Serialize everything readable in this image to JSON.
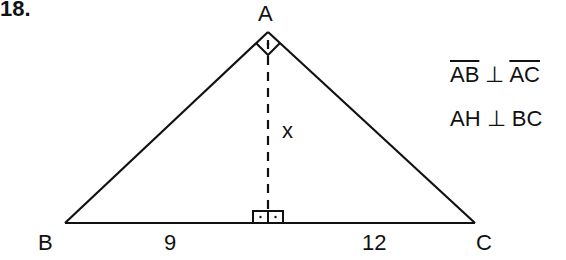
{
  "problem": {
    "number": "18."
  },
  "diagram": {
    "vertices": {
      "A": "A",
      "B": "B",
      "C": "C"
    },
    "segments": {
      "BH": "9",
      "HC": "12",
      "AH": "x"
    },
    "right_angles": [
      "A",
      "H"
    ]
  },
  "relations": {
    "line1": {
      "left": "AB",
      "symbol": "⊥",
      "right": "AC",
      "overline": true
    },
    "line2": {
      "left": "AH",
      "symbol": "⊥",
      "right": "BC",
      "overline": false
    }
  }
}
